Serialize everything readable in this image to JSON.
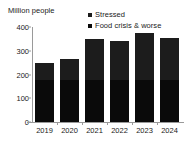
{
  "chart_data": {
    "type": "bar",
    "subtype": "stacked-bar",
    "title": "",
    "axis_unit_title": "Million people",
    "xlabel": "",
    "ylabel": "Million people",
    "categories": [
      "2019",
      "2020",
      "2021",
      "2022",
      "2023",
      "2024"
    ],
    "series": [
      {
        "name": "Food crisis & worse",
        "color": "#0a0a0a",
        "values": [
          177,
          177,
          177,
          177,
          177,
          177
        ]
      },
      {
        "name": "Stressed",
        "color": "#1c1c1c",
        "values": [
          73,
          88,
          173,
          165,
          198,
          176
        ]
      }
    ],
    "totals": [
      250,
      265,
      350,
      342,
      375,
      353
    ],
    "ylim": [
      0,
      400
    ],
    "yticks": [
      0,
      100,
      200,
      300,
      400
    ],
    "ytick_labels": [
      "0",
      "100",
      "200",
      "300",
      "400"
    ],
    "grid": false,
    "legend_position": "top-right",
    "legend": [
      {
        "label": "Stressed",
        "color": "#1c1c1c"
      },
      {
        "label": "Food crisis & worse",
        "color": "#0a0a0a"
      }
    ]
  },
  "colors": {
    "background": "#ffffff",
    "axis": "#9a9a9a",
    "text": "#1a1a1a",
    "stressed": "#1c1c1c",
    "food_crisis": "#0a0a0a"
  }
}
